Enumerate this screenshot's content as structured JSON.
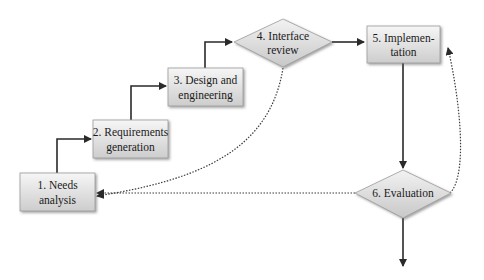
{
  "diagram": {
    "type": "flowchart",
    "nodes": [
      {
        "id": "n1",
        "shape": "box",
        "line1": "1. Needs",
        "line2": "analysis"
      },
      {
        "id": "n2",
        "shape": "box",
        "line1": "2. Requirements",
        "line2": "generation"
      },
      {
        "id": "n3",
        "shape": "box",
        "line1": "3. Design and",
        "line2": "engineering"
      },
      {
        "id": "n4",
        "shape": "diamond",
        "line1": "4. Interface",
        "line2": "review"
      },
      {
        "id": "n5",
        "shape": "box",
        "line1": "5. Implemen-",
        "line2": "tation"
      },
      {
        "id": "n6",
        "shape": "diamond",
        "line1": "6. Evaluation"
      }
    ],
    "edges": [
      {
        "from": "n1",
        "to": "n2",
        "style": "solid"
      },
      {
        "from": "n2",
        "to": "n3",
        "style": "solid"
      },
      {
        "from": "n3",
        "to": "n4",
        "style": "solid"
      },
      {
        "from": "n4",
        "to": "n5",
        "style": "solid"
      },
      {
        "from": "n5",
        "to": "n6",
        "style": "solid"
      },
      {
        "from": "n6",
        "to": "exit",
        "style": "solid"
      },
      {
        "from": "n4",
        "to": "n1",
        "style": "dotted"
      },
      {
        "from": "n6",
        "to": "n1",
        "style": "dotted"
      },
      {
        "from": "n6",
        "to": "n5",
        "style": "dotted"
      }
    ],
    "colors": {
      "box_fill_top": "#f4f4f4",
      "box_fill_bottom": "#cfcfcf",
      "box_border": "#9a9a9a",
      "arrow": "#2a2a2a",
      "text": "#1a1a1a"
    }
  }
}
